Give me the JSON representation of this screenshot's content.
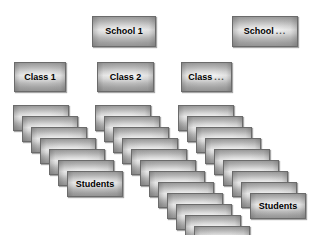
{
  "diagram": {
    "background_color": "#ffffff",
    "card_border_color": "#6b6b6b",
    "card_fill_light": "#f2f2f2",
    "card_fill_dark": "#949494",
    "label_color": "#000000",
    "ellipsis_text": "...",
    "schools": [
      {
        "id": "school-1",
        "label": "School 1",
        "has_ellipsis": false,
        "x": 92,
        "y": 16,
        "width": 64,
        "height": 31
      },
      {
        "id": "school-n",
        "label": "School",
        "has_ellipsis": true,
        "x": 232,
        "y": 16,
        "width": 66,
        "height": 31
      }
    ],
    "classes": [
      {
        "id": "class-1",
        "label": "Class 1",
        "has_ellipsis": false,
        "x": 14,
        "y": 62,
        "width": 52,
        "height": 30
      },
      {
        "id": "class-2",
        "label": "Class 2",
        "has_ellipsis": false,
        "x": 97,
        "y": 62,
        "width": 57,
        "height": 30
      },
      {
        "id": "class-n",
        "label": "Class",
        "has_ellipsis": true,
        "x": 181,
        "y": 62,
        "width": 51,
        "height": 30
      }
    ],
    "student_stacks": [
      {
        "id": "students-stack-1",
        "label": "Students",
        "parent_class": "Class 1",
        "count": 7,
        "x": 13,
        "y": 105,
        "step_x": 9,
        "step_y": 11,
        "card_width": 56,
        "card_height": 26
      },
      {
        "id": "students-stack-2",
        "label": "Students",
        "parent_class": "Class 2",
        "count": 12,
        "x": 95,
        "y": 105,
        "step_x": 9,
        "step_y": 11,
        "card_width": 56,
        "card_height": 26
      },
      {
        "id": "students-stack-3",
        "label": "Students",
        "parent_class": "Class ...",
        "count": 9,
        "x": 178,
        "y": 105,
        "step_x": 9,
        "step_y": 11,
        "card_width": 56,
        "card_height": 26
      }
    ]
  }
}
